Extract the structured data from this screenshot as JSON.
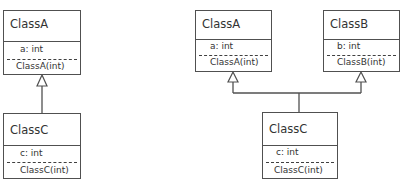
{
  "diagrams": [
    {
      "type": "single-inheritance",
      "classes": [
        {
          "id": "left-classA",
          "name": "ClassA",
          "attribute": "a: int",
          "method": "ClassA(int)"
        },
        {
          "id": "left-classC",
          "name": "ClassC",
          "attribute": "c: int",
          "method": "ClassC(int)"
        }
      ],
      "relations": [
        {
          "from": "ClassC",
          "to": "ClassA",
          "kind": "generalization"
        }
      ]
    },
    {
      "type": "multiple-inheritance",
      "classes": [
        {
          "id": "right-classA",
          "name": "ClassA",
          "attribute": "a: int",
          "method": "ClassA(int)"
        },
        {
          "id": "right-classB",
          "name": "ClassB",
          "attribute": "b: int",
          "method": "ClassB(int)"
        },
        {
          "id": "right-classC",
          "name": "ClassC",
          "attribute": "c: int",
          "method": "ClassC(int)"
        }
      ],
      "relations": [
        {
          "from": "ClassC",
          "to": "ClassA",
          "kind": "generalization"
        },
        {
          "from": "ClassC",
          "to": "ClassB",
          "kind": "generalization"
        }
      ]
    }
  ],
  "colors": {
    "line": "#505050",
    "text": "#333333",
    "background": "#ffffff"
  }
}
